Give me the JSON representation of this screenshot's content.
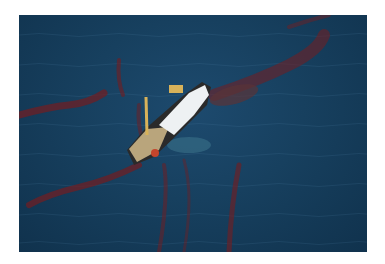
{
  "image": {
    "description": "Aerial photo of a ship surrounded by dark red oil streaks on deep blue ocean water",
    "colors": {
      "water": "#17405f",
      "water_dark": "#10324d",
      "oil": "#6e1f24",
      "ship_white": "#eef1f3",
      "ship_deck": "#b9a57c",
      "crane": "#d8b25a"
    }
  }
}
